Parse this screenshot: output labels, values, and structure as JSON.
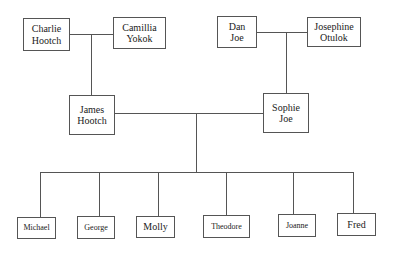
{
  "diagram": {
    "type": "family-tree",
    "grandparents_left": {
      "father": {
        "name": "Charlie\nHootch"
      },
      "mother": {
        "name": "Camillia\nYokok"
      }
    },
    "grandparents_right": {
      "father": {
        "name": "Dan\nJoe"
      },
      "mother": {
        "name": "Josephine\nOtulok"
      }
    },
    "parents": {
      "father": {
        "name": "James\nHootch"
      },
      "mother": {
        "name": "Sophie\nJoe"
      }
    },
    "children": [
      {
        "name": "Michael"
      },
      {
        "name": "George"
      },
      {
        "name": "Molly"
      },
      {
        "name": "Theodore"
      },
      {
        "name": "Joanne"
      },
      {
        "name": "Fred"
      }
    ]
  }
}
